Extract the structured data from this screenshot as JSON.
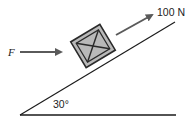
{
  "diagram": {
    "type": "inclined-plane-force-diagram",
    "incline_angle_label": "30°",
    "applied_force": {
      "label": "F",
      "direction": "horizontal"
    },
    "pull_force": {
      "label": "100 N",
      "direction": "up-slope"
    },
    "object": "crate",
    "colors": {
      "line": "#1a1a1a",
      "arrow": "#5a5a5a",
      "crate_fill": "#b9b9b9",
      "crate_border": "#2a2a2a"
    }
  }
}
